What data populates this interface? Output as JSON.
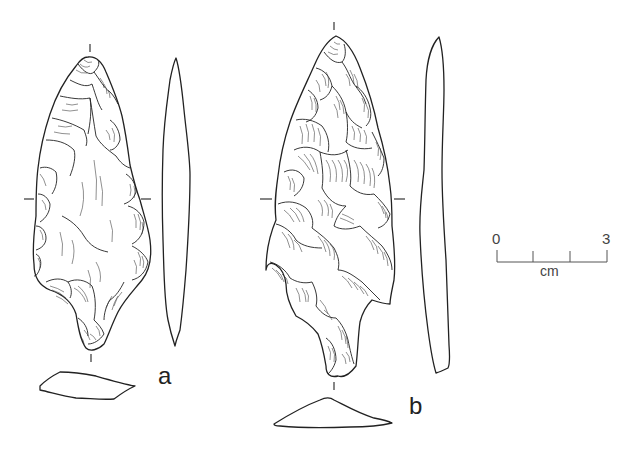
{
  "figure": {
    "artifacts": [
      {
        "id": "a",
        "label": "a"
      },
      {
        "id": "b",
        "label": "b"
      }
    ],
    "scale_bar": {
      "start_label": "0",
      "end_label": "3",
      "unit_label": "cm",
      "divisions": 3
    },
    "colors": {
      "ink": "#222222",
      "background": "#ffffff",
      "scale_ink": "#555555"
    }
  }
}
